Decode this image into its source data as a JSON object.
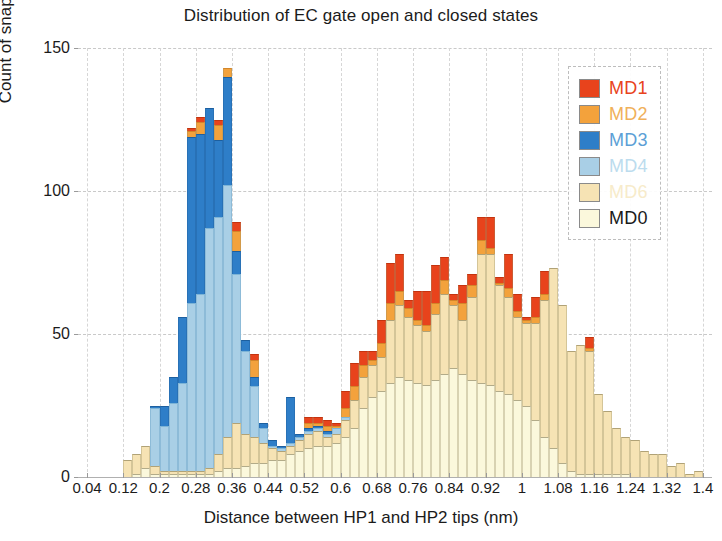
{
  "chart_data": {
    "type": "bar",
    "subtype": "stacked-histogram",
    "title": "Distribution of EC gate open and closed states",
    "xlabel": "Distance between HP1 and HP2 tips (nm)",
    "ylabel": "Count of snapshots",
    "xlim": [
      0.02,
      1.42
    ],
    "ylim": [
      0,
      150
    ],
    "yticks": [
      0,
      50,
      100,
      150
    ],
    "xticks": [
      0.04,
      0.12,
      0.2,
      0.28,
      0.36,
      0.44,
      0.52,
      0.6,
      0.68,
      0.76,
      0.84,
      0.92,
      1,
      1.08,
      1.16,
      1.24,
      1.32,
      1.4
    ],
    "grid": true,
    "bin_width": 0.02,
    "legend_position": "top-right",
    "stack_order_bottom_to_top": [
      "MD0",
      "MD6",
      "MD4",
      "MD3",
      "MD2",
      "MD1"
    ],
    "colors": {
      "MD1": "#E8431C",
      "MD2": "#F6A githubE3B",
      "MD3": "#2E7EC8",
      "MD4": "#A9CFE6",
      "MD6": "#F6E3B4",
      "MD0": "#FBF8DC"
    },
    "series": [
      {
        "name": "MD1",
        "color": "#E8431C"
      },
      {
        "name": "MD2",
        "color": "#F3A23C"
      },
      {
        "name": "MD3",
        "color": "#2E7EC8"
      },
      {
        "name": "MD4",
        "color": "#A9CFE6"
      },
      {
        "name": "MD6",
        "color": "#F6E3B4"
      },
      {
        "name": "MD0",
        "color": "#FBF8DC"
      }
    ],
    "x": [
      0.13,
      0.15,
      0.17,
      0.19,
      0.21,
      0.23,
      0.25,
      0.27,
      0.29,
      0.31,
      0.33,
      0.35,
      0.37,
      0.39,
      0.41,
      0.43,
      0.45,
      0.47,
      0.49,
      0.51,
      0.53,
      0.55,
      0.57,
      0.59,
      0.61,
      0.63,
      0.65,
      0.67,
      0.69,
      0.71,
      0.73,
      0.75,
      0.77,
      0.79,
      0.81,
      0.83,
      0.85,
      0.87,
      0.89,
      0.91,
      0.93,
      0.95,
      0.97,
      0.99,
      1.01,
      1.03,
      1.05,
      1.07,
      1.09,
      1.11,
      1.13,
      1.15,
      1.17,
      1.19,
      1.21,
      1.23,
      1.25,
      1.27,
      1.29,
      1.31,
      1.33,
      1.35,
      1.37,
      1.39
    ],
    "stacks": [
      {
        "MD0": 0,
        "MD6": 6,
        "MD4": 0,
        "MD3": 0,
        "MD2": 0,
        "MD1": 0
      },
      {
        "MD0": 1,
        "MD6": 7,
        "MD4": 0,
        "MD3": 0,
        "MD2": 0,
        "MD1": 0
      },
      {
        "MD0": 3,
        "MD6": 8,
        "MD4": 0,
        "MD3": 0,
        "MD2": 0,
        "MD1": 0
      },
      {
        "MD0": 1,
        "MD6": 3,
        "MD4": 20,
        "MD3": 1,
        "MD2": 0,
        "MD1": 0
      },
      {
        "MD0": 1,
        "MD6": 1,
        "MD4": 16,
        "MD3": 7,
        "MD2": 0,
        "MD1": 0
      },
      {
        "MD0": 1,
        "MD6": 1,
        "MD4": 24,
        "MD3": 9,
        "MD2": 0,
        "MD1": 0
      },
      {
        "MD0": 1,
        "MD6": 1,
        "MD4": 31,
        "MD3": 23,
        "MD2": 0,
        "MD1": 0
      },
      {
        "MD0": 1,
        "MD6": 1,
        "MD4": 59,
        "MD3": 58,
        "MD2": 2,
        "MD1": 1
      },
      {
        "MD0": 1,
        "MD6": 1,
        "MD4": 62,
        "MD3": 56,
        "MD2": 4,
        "MD1": 2
      },
      {
        "MD0": 1,
        "MD6": 2,
        "MD4": 84,
        "MD3": 42,
        "MD2": 0,
        "MD1": 0
      },
      {
        "MD0": 2,
        "MD6": 6,
        "MD4": 83,
        "MD3": 27,
        "MD2": 5,
        "MD1": 2
      },
      {
        "MD0": 3,
        "MD6": 11,
        "MD4": 88,
        "MD3": 38,
        "MD2": 3,
        "MD1": 0
      },
      {
        "MD0": 3,
        "MD6": 16,
        "MD4": 52,
        "MD3": 8,
        "MD2": 7,
        "MD1": 3
      },
      {
        "MD0": 4,
        "MD6": 11,
        "MD4": 29,
        "MD3": 4,
        "MD2": 0,
        "MD1": 0
      },
      {
        "MD0": 5,
        "MD6": 9,
        "MD4": 18,
        "MD3": 3,
        "MD2": 6,
        "MD1": 2
      },
      {
        "MD0": 5,
        "MD6": 7,
        "MD4": 5,
        "MD3": 2,
        "MD2": 0,
        "MD1": 0
      },
      {
        "MD0": 6,
        "MD6": 4,
        "MD4": 1,
        "MD3": 2,
        "MD2": 0,
        "MD1": 0
      },
      {
        "MD0": 6,
        "MD6": 3,
        "MD4": 1,
        "MD3": 1,
        "MD2": 0,
        "MD1": 0
      },
      {
        "MD0": 8,
        "MD6": 3,
        "MD4": 1,
        "MD3": 16,
        "MD2": 0,
        "MD1": 0
      },
      {
        "MD0": 9,
        "MD6": 4,
        "MD4": 1,
        "MD3": 1,
        "MD2": 0,
        "MD1": 0
      },
      {
        "MD0": 10,
        "MD6": 5,
        "MD4": 1,
        "MD3": 1,
        "MD2": 2,
        "MD1": 2
      },
      {
        "MD0": 11,
        "MD6": 5,
        "MD4": 1,
        "MD3": 1,
        "MD2": 1,
        "MD1": 2
      },
      {
        "MD0": 11,
        "MD6": 3,
        "MD4": 1,
        "MD3": 1,
        "MD2": 2,
        "MD1": 2
      },
      {
        "MD0": 12,
        "MD6": 3,
        "MD4": 2,
        "MD3": 0,
        "MD2": 1,
        "MD1": 1
      },
      {
        "MD0": 14,
        "MD6": 6,
        "MD4": 1,
        "MD3": 0,
        "MD2": 3,
        "MD1": 6
      },
      {
        "MD0": 17,
        "MD6": 10,
        "MD4": 0,
        "MD3": 0,
        "MD2": 5,
        "MD1": 8
      },
      {
        "MD0": 24,
        "MD6": 11,
        "MD4": 0,
        "MD3": 0,
        "MD2": 4,
        "MD1": 5
      },
      {
        "MD0": 28,
        "MD6": 11,
        "MD4": 0,
        "MD3": 0,
        "MD2": 2,
        "MD1": 3
      },
      {
        "MD0": 30,
        "MD6": 12,
        "MD4": 0,
        "MD3": 0,
        "MD2": 5,
        "MD1": 8
      },
      {
        "MD0": 33,
        "MD6": 22,
        "MD4": 0,
        "MD3": 0,
        "MD2": 6,
        "MD1": 14
      },
      {
        "MD0": 35,
        "MD6": 25,
        "MD4": 0,
        "MD3": 0,
        "MD2": 5,
        "MD1": 13
      },
      {
        "MD0": 34,
        "MD6": 22,
        "MD4": 0,
        "MD3": 0,
        "MD2": 3,
        "MD1": 3
      },
      {
        "MD0": 33,
        "MD6": 20,
        "MD4": 0,
        "MD3": 0,
        "MD2": 2,
        "MD1": 10
      },
      {
        "MD0": 32,
        "MD6": 19,
        "MD4": 0,
        "MD3": 0,
        "MD2": 2,
        "MD1": 12
      },
      {
        "MD0": 34,
        "MD6": 23,
        "MD4": 0,
        "MD3": 0,
        "MD2": 4,
        "MD1": 13
      },
      {
        "MD0": 36,
        "MD6": 28,
        "MD4": 0,
        "MD3": 0,
        "MD2": 5,
        "MD1": 8
      },
      {
        "MD0": 38,
        "MD6": 22,
        "MD4": 0,
        "MD3": 0,
        "MD2": 2,
        "MD1": 2
      },
      {
        "MD0": 36,
        "MD6": 19,
        "MD4": 0,
        "MD3": 0,
        "MD2": 6,
        "MD1": 6
      },
      {
        "MD0": 34,
        "MD6": 29,
        "MD4": 0,
        "MD3": 0,
        "MD2": 4,
        "MD1": 4
      },
      {
        "MD0": 33,
        "MD6": 45,
        "MD4": 0,
        "MD3": 0,
        "MD2": 5,
        "MD1": 8
      },
      {
        "MD0": 32,
        "MD6": 46,
        "MD4": 0,
        "MD3": 0,
        "MD2": 2,
        "MD1": 11
      },
      {
        "MD0": 30,
        "MD6": 37,
        "MD4": 0,
        "MD3": 0,
        "MD2": 1,
        "MD1": 2
      },
      {
        "MD0": 29,
        "MD6": 34,
        "MD4": 0,
        "MD3": 0,
        "MD2": 3,
        "MD1": 12
      },
      {
        "MD0": 27,
        "MD6": 29,
        "MD4": 0,
        "MD3": 0,
        "MD2": 2,
        "MD1": 6
      },
      {
        "MD0": 25,
        "MD6": 29,
        "MD4": 0,
        "MD3": 0,
        "MD2": 1,
        "MD1": 1
      },
      {
        "MD0": 20,
        "MD6": 34,
        "MD4": 0,
        "MD3": 0,
        "MD2": 2,
        "MD1": 7
      },
      {
        "MD0": 14,
        "MD6": 48,
        "MD4": 0,
        "MD3": 0,
        "MD2": 2,
        "MD1": 8
      },
      {
        "MD0": 10,
        "MD6": 63,
        "MD4": 0,
        "MD3": 0,
        "MD2": 0,
        "MD1": 0
      },
      {
        "MD0": 5,
        "MD6": 55,
        "MD4": 0,
        "MD3": 0,
        "MD2": 0,
        "MD1": 0
      },
      {
        "MD0": 2,
        "MD6": 42,
        "MD4": 0,
        "MD3": 0,
        "MD2": 0,
        "MD1": 0
      },
      {
        "MD0": 1,
        "MD6": 45,
        "MD4": 0,
        "MD3": 0,
        "MD2": 0,
        "MD1": 0
      },
      {
        "MD0": 1,
        "MD6": 43,
        "MD4": 0,
        "MD3": 0,
        "MD2": 1,
        "MD1": 4
      },
      {
        "MD0": 1,
        "MD6": 28,
        "MD4": 0,
        "MD3": 0,
        "MD2": 0,
        "MD1": 0
      },
      {
        "MD0": 1,
        "MD6": 22,
        "MD4": 0,
        "MD3": 0,
        "MD2": 0,
        "MD1": 0
      },
      {
        "MD0": 1,
        "MD6": 16,
        "MD4": 0,
        "MD3": 0,
        "MD2": 0,
        "MD1": 0
      },
      {
        "MD0": 1,
        "MD6": 13,
        "MD4": 0,
        "MD3": 0,
        "MD2": 0,
        "MD1": 0
      },
      {
        "MD0": 0,
        "MD6": 13,
        "MD4": 0,
        "MD3": 0,
        "MD2": 0,
        "MD1": 0
      },
      {
        "MD0": 0,
        "MD6": 9,
        "MD4": 0,
        "MD3": 0,
        "MD2": 0,
        "MD1": 0
      },
      {
        "MD0": 0,
        "MD6": 8,
        "MD4": 0,
        "MD3": 0,
        "MD2": 0,
        "MD1": 0
      },
      {
        "MD0": 0,
        "MD6": 8,
        "MD4": 0,
        "MD3": 0,
        "MD2": 0,
        "MD1": 0
      },
      {
        "MD0": 0,
        "MD6": 4,
        "MD4": 0,
        "MD3": 0,
        "MD2": 0,
        "MD1": 0
      },
      {
        "MD0": 0,
        "MD6": 5,
        "MD4": 0,
        "MD3": 0,
        "MD2": 0,
        "MD1": 0
      },
      {
        "MD0": 0,
        "MD6": 1,
        "MD4": 0,
        "MD3": 0,
        "MD2": 0,
        "MD1": 0
      },
      {
        "MD0": 0,
        "MD6": 2,
        "MD4": 0,
        "MD3": 0,
        "MD2": 0,
        "MD1": 0
      }
    ]
  },
  "legend": {
    "items": [
      {
        "label": "MD1",
        "color": "#E8431C",
        "text_color": "#E8431C"
      },
      {
        "label": "MD2",
        "color": "#F3A23C",
        "text_color": "#F0B05A"
      },
      {
        "label": "MD3",
        "color": "#2E7EC8",
        "text_color": "#5C9FD6"
      },
      {
        "label": "MD4",
        "color": "#A9CFE6",
        "text_color": "#BCDCEE"
      },
      {
        "label": "MD6",
        "color": "#F6E3B4",
        "text_color": "#F7EBCA"
      },
      {
        "label": "MD0",
        "color": "#FBF8DC",
        "text_color": "#1a1a1a"
      }
    ]
  }
}
